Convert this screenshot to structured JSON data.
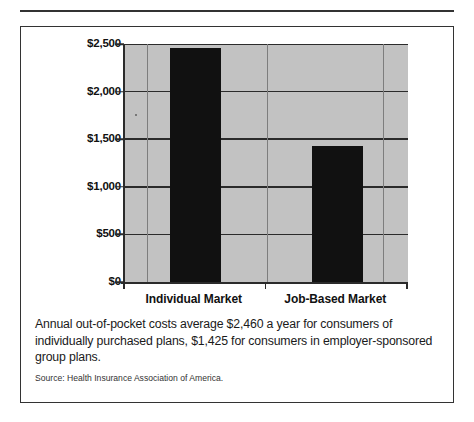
{
  "figure": {
    "caption": "Annual out-of-pocket costs average $2,460 a year for consumers of individually purchased plans, $1,425 for consumers in employer-sponsored group plans.",
    "source": "Source:  Health Insurance Association of America."
  },
  "chart_data": {
    "type": "bar",
    "title": "",
    "xlabel": "",
    "ylabel": "",
    "categories": [
      "Individual Market",
      "Job-Based Market"
    ],
    "values": [
      2460,
      1425
    ],
    "value_labels": [
      "$2,460",
      "$1,425"
    ],
    "ylim": [
      0,
      2500
    ],
    "yticks": [
      0,
      500,
      1000,
      1500,
      2000,
      2500
    ],
    "ytick_labels": [
      "$0",
      "$500",
      "$1,000",
      "$1,500",
      "$2,000",
      "$2,500"
    ],
    "grid": "horizontal-and-vertical",
    "legend": "none",
    "plot_background": "#c2c2c2",
    "bar_color": "#111111"
  }
}
